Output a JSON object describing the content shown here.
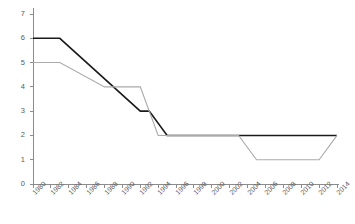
{
  "chart_data": {
    "type": "line",
    "title": "",
    "subtitle": "",
    "xlabel": "",
    "ylabel": "",
    "xlim": [
      1980,
      2014
    ],
    "ylim": [
      0,
      7
    ],
    "grid": false,
    "legend_position": "none",
    "x_tick_labels": [
      "1980",
      "1982",
      "1984",
      "1986",
      "1988",
      "1990",
      "1992",
      "1994",
      "1996",
      "1998",
      "2000",
      "2002",
      "2004",
      "2006",
      "2008",
      "2010",
      "2012",
      "2014"
    ],
    "y_tick_labels": [
      "0",
      "1",
      "2",
      "3",
      "4",
      "5",
      "6",
      "7"
    ],
    "x_tick_values": [
      1980,
      1982,
      1984,
      1986,
      1988,
      1990,
      1992,
      1994,
      1996,
      1998,
      2000,
      2002,
      2004,
      2006,
      2008,
      2010,
      2012,
      2014
    ],
    "y_tick_values": [
      0,
      1,
      2,
      3,
      4,
      5,
      6,
      7
    ],
    "series": [
      {
        "name": "series-black",
        "color": "#1a1a1a",
        "width": 1.6,
        "x": [
          1980,
          1983,
          1992,
          1993,
          1995,
          1997,
          2014
        ],
        "values": [
          6,
          6,
          3,
          3,
          2,
          2,
          2
        ]
      },
      {
        "name": "series-gray",
        "color": "#aaaaaa",
        "width": 1.1,
        "x": [
          1980,
          1983,
          1988,
          1992,
          1994,
          2003,
          2005,
          2012,
          2014
        ],
        "values": [
          5,
          5,
          4,
          4,
          2,
          2,
          1,
          1,
          2
        ]
      }
    ],
    "annotations": []
  },
  "axes": {
    "axis_color": "#8c8c8c",
    "tick_color": "#8c8c8c",
    "label_color": "#5a5a5a",
    "background": "#ffffff"
  }
}
